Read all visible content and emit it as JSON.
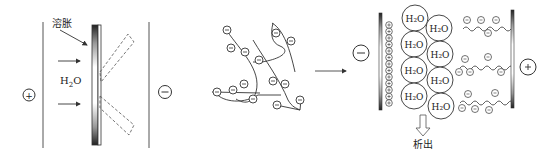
{
  "diagram": {
    "panel_left": {
      "anode_symbol": "+",
      "cathode_symbol": "−",
      "swelling_label": "溶胀",
      "water_label": "H",
      "water_sub": "2",
      "water_tail": "O"
    },
    "panel_middle": {
      "polymer_charge_symbol": "−"
    },
    "panel_right": {
      "cathode_symbol": "−",
      "anode_symbol": "+",
      "water_molecule": "H₂O",
      "water_count": 9,
      "precipitate_label": "析出",
      "electrode_charge": "+"
    },
    "colors": {
      "stroke": "#333333",
      "background": "#ffffff"
    }
  }
}
